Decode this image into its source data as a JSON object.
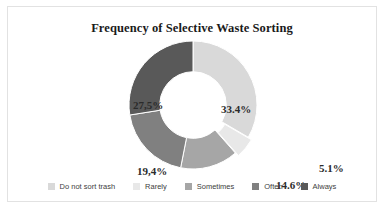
{
  "chart_data": {
    "type": "pie",
    "variant": "donut",
    "title": "Frequency of Selective Waste Sorting",
    "xlabel": "",
    "ylabel": "",
    "grid": false,
    "legend_position": "bottom",
    "hole_ratio": 0.52,
    "categories": [
      "Do not sort trash",
      "Rarely",
      "Sometimes",
      "Often",
      "Always"
    ],
    "values": [
      33.4,
      5.1,
      14.6,
      19.4,
      27.5
    ],
    "labels": [
      "33.4%",
      "5.1%",
      "14.6%",
      "19,4%",
      "27,5%"
    ],
    "colors": [
      "#d9d9d9",
      "#e8e8e8",
      "#a6a6a6",
      "#808080",
      "#595959"
    ],
    "slices": [
      {
        "category": "Do not sort trash",
        "value": 33.4,
        "label": "33.4%",
        "color": "#d9d9d9",
        "exploded": false
      },
      {
        "category": "Rarely",
        "value": 5.1,
        "label": "5.1%",
        "color": "#e8e8e8",
        "exploded": true
      },
      {
        "category": "Sometimes",
        "value": 14.6,
        "label": "14.6%",
        "color": "#a6a6a6",
        "exploded": false
      },
      {
        "category": "Often",
        "value": 19.4,
        "label": "19,4%",
        "color": "#808080",
        "exploded": false
      },
      {
        "category": "Always",
        "value": 27.5,
        "label": "27,5%",
        "color": "#595959",
        "exploded": false
      }
    ]
  },
  "frame": {
    "border_color": "#e2e2e2",
    "background": "#ffffff"
  }
}
